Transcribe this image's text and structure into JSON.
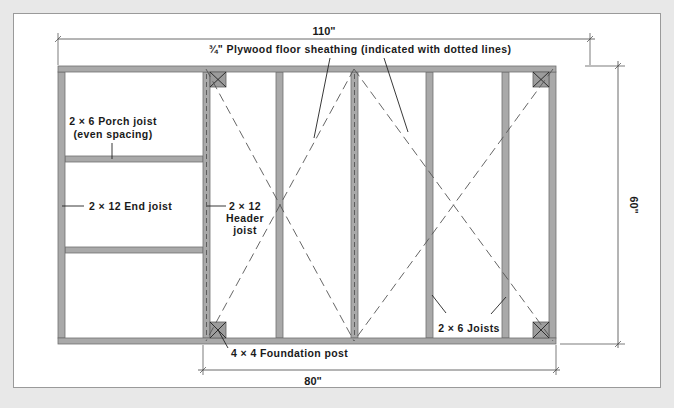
{
  "diagram": {
    "dimensions": {
      "overall_width": "110\"",
      "shed_width": "80\"",
      "depth": "60\""
    },
    "labels": {
      "sheathing": "¾\" Plywood floor sheathing (indicated with dotted lines)",
      "porch_joist_line1": "2 × 6 Porch joist",
      "porch_joist_line2": "(even spacing)",
      "end_joist": "2 × 12 End joist",
      "header_joist_line1": "2 × 12",
      "header_joist_line2": "Header",
      "header_joist_line3": "joist",
      "foundation_post": "4 × 4 Foundation post",
      "joists": "2 × 6 Joists"
    },
    "colors": {
      "background": "#e8e8e8",
      "panel": "#ffffff",
      "lumber": "#a9a9a9",
      "post": "#9c9c9c",
      "text": "#1a1a1a"
    }
  }
}
